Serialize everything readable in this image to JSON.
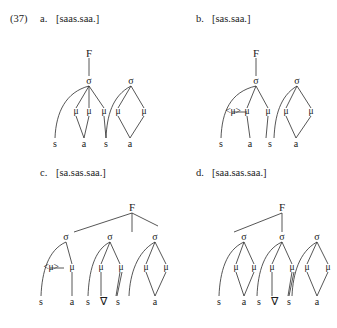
{
  "example": {
    "number": "(37)",
    "items": [
      {
        "letter": "a.",
        "form": "[saas.saa.]"
      },
      {
        "letter": "b.",
        "form": "[sas.saa.]"
      },
      {
        "letter": "c.",
        "form": "[sa.sas.saa.]"
      },
      {
        "letter": "d.",
        "form": "[saa.sas.saa.]"
      }
    ]
  },
  "glyphs": {
    "foot": "F",
    "syllable": "σ",
    "mora": "μ",
    "mora_deleted": "<μ>",
    "empty_vowel": "∇",
    "s": "s",
    "a": "a",
    "mora_subscript": "μ"
  },
  "trees": {
    "a": {
      "label": "tree-a",
      "root": "F",
      "syllables": [
        "σ",
        "σ"
      ],
      "moras": [
        "μ",
        "μ",
        "μ",
        "μ",
        "μ"
      ],
      "segments": [
        "s",
        "a",
        "s",
        "a"
      ]
    },
    "b": {
      "label": "tree-b",
      "root": "F",
      "syllables": [
        "σ",
        "σ"
      ],
      "moras": [
        "<μ>",
        "μ",
        "μ",
        "μ",
        "μ"
      ],
      "segments": [
        "s",
        "a",
        "s",
        "a"
      ]
    },
    "c": {
      "label": "tree-c",
      "root": "F",
      "syllables": [
        "σ",
        "σ",
        "σ"
      ],
      "moras": [
        "<μ>",
        "μ",
        "μ",
        "μ",
        "μ",
        "μ"
      ],
      "segments": [
        "s",
        "a",
        "s",
        "∇",
        "s",
        "a"
      ]
    },
    "d": {
      "label": "tree-d",
      "root": "F",
      "syllables": [
        "σ",
        "σ",
        "σ"
      ],
      "moras": [
        "μ",
        "μ",
        "μ",
        "μ",
        "μ",
        "μ"
      ],
      "segments": [
        "s",
        "a",
        "s",
        "∇",
        "s",
        "a"
      ]
    }
  },
  "colors": {
    "ink": "#1b1b1b",
    "line": "#2b2b2b",
    "background": "#ffffff"
  }
}
